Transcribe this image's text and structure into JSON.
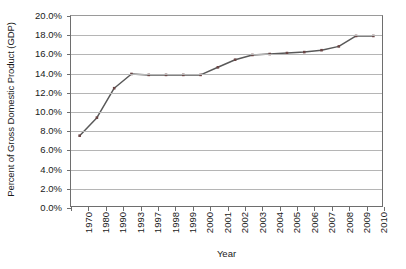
{
  "chart_data": {
    "type": "line",
    "title": "",
    "xlabel": "Year",
    "ylabel": "Percent of Gross Domestic Product (GDP)",
    "categories": [
      "1970",
      "1980",
      "1990",
      "1993",
      "1997",
      "1998",
      "1999",
      "2000",
      "2001",
      "2002",
      "2003",
      "2004",
      "2005",
      "2006",
      "2007",
      "2008",
      "2009",
      "2010"
    ],
    "values": [
      7.4,
      9.3,
      12.4,
      13.9,
      13.8,
      13.8,
      13.8,
      13.8,
      14.6,
      15.4,
      15.9,
      16.0,
      16.1,
      16.2,
      16.4,
      16.8,
      17.9,
      17.9
    ],
    "ylim": [
      0,
      20
    ],
    "ytick_labels": [
      "20.0%",
      "18.0%",
      "16.0%",
      "14.0%",
      "12.0%",
      "10.0%",
      "8.0%",
      "6.0%",
      "4.0%",
      "2.0%",
      "0.0%"
    ],
    "ytick_values": [
      20,
      18,
      16,
      14,
      12,
      10,
      8,
      6,
      4,
      2,
      0
    ],
    "grid": true,
    "legend": "none",
    "series_name": "Percent of GDP",
    "marker": "square"
  },
  "colors": {
    "line": "#595959",
    "marker": "#6b4646",
    "gridline": "#b5b5b5",
    "axis": "#6e6e6e",
    "text": "#1a1a1a",
    "background": "#ffffff"
  }
}
